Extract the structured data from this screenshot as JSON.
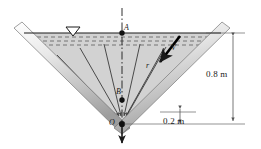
{
  "figure": {
    "type": "engineering-diagram"
  },
  "points": {
    "A": {
      "label": "A",
      "description": "point at water surface on centerline"
    },
    "B": {
      "label": "B",
      "description": "point on centerline above vertex"
    },
    "O": {
      "label": "O",
      "description": "vertex of V-channel, outflow point"
    }
  },
  "vectors": {
    "velocity": {
      "label": "V",
      "description": "velocity vector directed toward O"
    },
    "radius": {
      "label": "r",
      "description": "radial distance from O"
    }
  },
  "dimensions": [
    {
      "name": "depth",
      "value": "0.8 m"
    },
    {
      "name": "offset",
      "value": "0.2 m"
    }
  ],
  "symbols": {
    "water_surface": "water-surface-triangle"
  },
  "colors": {
    "water_fill": "#d2d2d2",
    "wall": "#cccccc",
    "line": "#1a1a1a",
    "dimension": "#555555"
  }
}
